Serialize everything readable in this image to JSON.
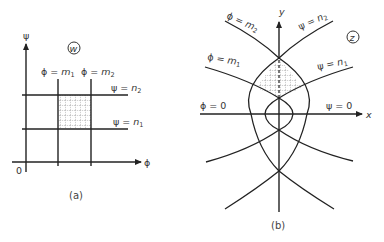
{
  "figure_a": {
    "caption": "(a)",
    "plane_label": "w",
    "axes": {
      "vertical_label": "ψ",
      "horizontal_label": "ϕ",
      "origin_label": "0"
    },
    "lines": {
      "phi_m1": {
        "lhs": "ϕ = ",
        "var": "m",
        "sub": "1"
      },
      "phi_m2": {
        "lhs": "ϕ = ",
        "var": "m",
        "sub": "2"
      },
      "psi_n1": {
        "lhs": "ψ = ",
        "var": "n",
        "sub": "1"
      },
      "psi_n2": {
        "lhs": "ψ = ",
        "var": "n",
        "sub": "2"
      }
    }
  },
  "figure_b": {
    "caption": "(b)",
    "plane_label": "z",
    "axes": {
      "vertical_label": "y",
      "horizontal_label": "x"
    },
    "lines": {
      "phi_m1": {
        "lhs": "ϕ = ",
        "var": "m",
        "sub": "1"
      },
      "phi_m2": {
        "lhs": "ϕ = ",
        "var": "m",
        "sub": "2"
      },
      "psi_n1": {
        "lhs": "ψ = ",
        "var": "n",
        "sub": "1"
      },
      "psi_n2": {
        "lhs": "ψ = ",
        "var": "n",
        "sub": "2"
      },
      "phi_0": "ϕ = 0",
      "psi_0": "ψ = 0"
    }
  }
}
